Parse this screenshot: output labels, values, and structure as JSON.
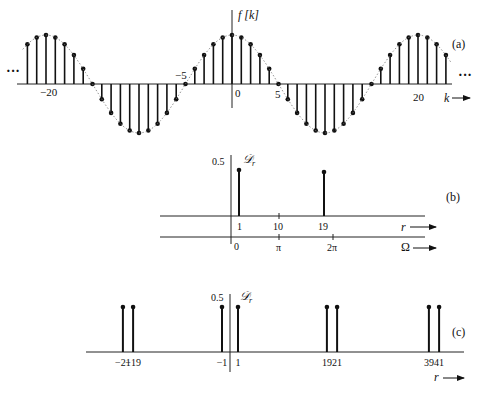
{
  "chart_data": [
    {
      "id": "a",
      "type": "stem",
      "title": "",
      "panel_label": "(a)",
      "ylabel": "f[k]",
      "xlabel": "k",
      "function": "cos(pi*k/10)",
      "x_ticks": [
        -20,
        -5,
        0,
        5,
        20
      ],
      "x_tick_labels": [
        "−20",
        "−5",
        "0",
        "5",
        "20"
      ],
      "xlim": [
        -22,
        23
      ],
      "ylim": [
        -1,
        1
      ],
      "continuation": "...",
      "envelope": "dotted",
      "x": [
        -22,
        -21,
        -20,
        -19,
        -18,
        -17,
        -16,
        -15,
        -14,
        -13,
        -12,
        -11,
        -10,
        -9,
        -8,
        -7,
        -6,
        -5,
        -4,
        -3,
        -2,
        -1,
        0,
        1,
        2,
        3,
        4,
        5,
        6,
        7,
        8,
        9,
        10,
        11,
        12,
        13,
        14,
        15,
        16,
        17,
        18,
        19,
        20,
        21,
        22,
        23
      ],
      "values": [
        0.81,
        0.95,
        1,
        0.95,
        0.81,
        0.59,
        0.31,
        0,
        -0.31,
        -0.59,
        -0.81,
        -0.95,
        -1,
        -0.95,
        -0.81,
        -0.59,
        -0.31,
        0,
        0.31,
        0.59,
        0.81,
        0.95,
        1,
        0.95,
        0.81,
        0.59,
        0.31,
        0,
        -0.31,
        -0.59,
        -0.81,
        -0.95,
        -1,
        -0.95,
        -0.81,
        -0.59,
        -0.31,
        0,
        0.31,
        0.59,
        0.81,
        0.95,
        1,
        0.95,
        0.81,
        0.59
      ]
    },
    {
      "id": "b",
      "type": "stem",
      "panel_label": "(b)",
      "ylabel": "𝒟r",
      "xlabel": "r",
      "xlabel2": "Ω",
      "y_tick_labels": [
        "0.5"
      ],
      "x_ticks": [
        1,
        10,
        19
      ],
      "x_tick_labels": [
        "1",
        "10",
        "19"
      ],
      "omega_ticks": [
        0,
        10,
        20
      ],
      "omega_tick_labels": [
        "0",
        "π",
        "2π"
      ],
      "x": [
        1,
        19
      ],
      "values": [
        0.5,
        0.5
      ]
    },
    {
      "id": "c",
      "type": "stem",
      "panel_label": "(c)",
      "ylabel": "𝒟r",
      "xlabel": "r",
      "y_tick_labels": [
        "0.5"
      ],
      "x": [
        -21,
        -19,
        -1,
        1,
        19,
        21,
        39,
        41
      ],
      "x_tick_labels": [
        "−21",
        "−19",
        "−1",
        "1",
        "19",
        "21",
        "39",
        "41"
      ],
      "values": [
        0.5,
        0.5,
        0.5,
        0.5,
        0.5,
        0.5,
        0.5,
        0.5
      ]
    }
  ],
  "labels": {
    "a_panel": "(a)",
    "b_panel": "(b)",
    "c_panel": "(c)",
    "f_label": "f [k]",
    "k_label": "k",
    "r_label": "r",
    "omega_label": "Ω",
    "D_label": "𝒟",
    "D_sub": "r",
    "half": "0.5",
    "dots": "···"
  }
}
